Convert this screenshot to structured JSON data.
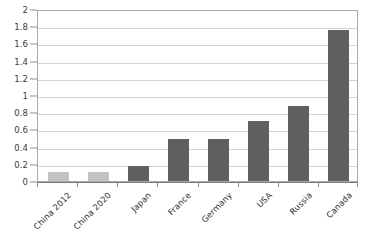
{
  "chart_data": {
    "type": "bar",
    "title": "",
    "subtitle": "",
    "xlabel": "",
    "ylabel": "",
    "categories": [
      "China 2012",
      "China 2020",
      "Japan",
      "France",
      "Germany",
      "USA",
      "Russia",
      "Canada"
    ],
    "values": [
      0.1,
      0.1,
      0.17,
      0.49,
      0.49,
      0.7,
      0.87,
      1.76
    ],
    "bar_colors": [
      "#c3c3c3",
      "#c3c3c3",
      "#5f5f5f",
      "#5f5f5f",
      "#5f5f5f",
      "#5f5f5f",
      "#5f5f5f",
      "#5f5f5f"
    ],
    "ylim": [
      0,
      2
    ],
    "ytick_step": 0.2,
    "ytick_labels": [
      "0",
      "0.2",
      "0.4",
      "0.6",
      "0.8",
      "1",
      "1.2",
      "1.4",
      "1.6",
      "1.8",
      "2"
    ],
    "ytick_values": [
      0,
      0.2,
      0.4,
      0.6,
      0.8,
      1,
      1.2,
      1.4,
      1.6,
      1.8,
      2
    ],
    "grid": true,
    "grid_axis": "y",
    "legend": false,
    "legend_position": "none",
    "annotations": [],
    "colors": {
      "background": "#ffffff",
      "gridline": "#d2d2d2",
      "plot_border": "#a9a9a9",
      "axis": "#7a7a7a",
      "tick_text": "#3a3a3a",
      "category_text": "#2f2f2f",
      "bar_light": "#c3c3c3",
      "bar_dark": "#5f5f5f"
    }
  }
}
